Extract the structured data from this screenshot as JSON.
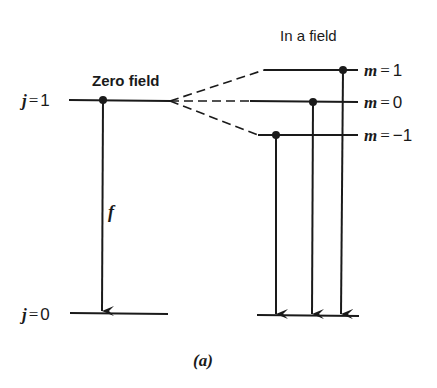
{
  "figure": {
    "caption": "(a)",
    "left_panel": {
      "title": "Zero field",
      "upper_level": {
        "var": "j",
        "eq": "=",
        "value": "1"
      },
      "lower_level": {
        "var": "j",
        "eq": "=",
        "value": "0"
      },
      "transition_label": "f"
    },
    "right_panel": {
      "title": "In a field",
      "sublevels": [
        {
          "var": "m",
          "eq": "=",
          "value": "1"
        },
        {
          "var": "m",
          "eq": "=",
          "value": "0"
        },
        {
          "var": "m",
          "eq": "=",
          "value": "−1"
        }
      ]
    }
  },
  "colors": {
    "ink": "#1a1a1a",
    "background": "#ffffff"
  }
}
